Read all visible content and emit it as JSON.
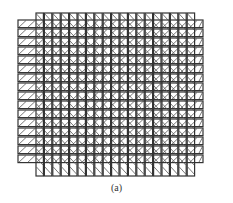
{
  "figure": {
    "caption": "(a)",
    "colors": {
      "stroke": "#333333",
      "hatch": "#555555",
      "background": "#ffffff"
    },
    "vertical_bars": {
      "count": 19,
      "x_start": 36,
      "pitch": 8.4,
      "width": 7.4,
      "top": 13,
      "bottom": 176,
      "hatch_direction": "backslash"
    },
    "horizontal_bars": {
      "count": 16,
      "y_start": 20,
      "pitch": 9.0,
      "height": 7.6,
      "left": 18,
      "right": 203,
      "hatch_direction": "slash"
    }
  }
}
